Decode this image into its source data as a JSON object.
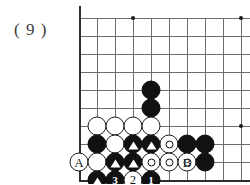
{
  "figure": {
    "label": "( 9 )",
    "caption_number": "9"
  },
  "colors": {
    "black_stone": "#111114",
    "white_stone": "#ffffff",
    "grid_line": "#6e6e72",
    "board_edge": "#2e2e32",
    "background": "#ffffff",
    "text": "#1b1b1d"
  },
  "board": {
    "type": "go-board-corner",
    "origin_x": 79,
    "origin_y": 18,
    "cell": 18,
    "cols": 10,
    "rows": 9,
    "star_points": [
      {
        "col": 3,
        "row": 0
      },
      {
        "col": 9,
        "row": 0
      },
      {
        "col": 9,
        "row": 6
      }
    ],
    "edges": {
      "left": true,
      "bottom": true,
      "top": false,
      "right": false
    }
  },
  "coordinate_labels": [
    {
      "text": "A",
      "col": 0,
      "row": 8
    },
    {
      "text": "B",
      "col": 6,
      "row": 8
    }
  ],
  "stones": [
    {
      "color": "black",
      "col": 4,
      "row": 4,
      "mark": "none",
      "label": ""
    },
    {
      "color": "black",
      "col": 4,
      "row": 5,
      "mark": "none",
      "label": ""
    },
    {
      "color": "white",
      "col": 1,
      "row": 6,
      "mark": "none",
      "label": ""
    },
    {
      "color": "white",
      "col": 2,
      "row": 6,
      "mark": "none",
      "label": ""
    },
    {
      "color": "white",
      "col": 3,
      "row": 6,
      "mark": "none",
      "label": ""
    },
    {
      "color": "black",
      "col": 1,
      "row": 7,
      "mark": "none",
      "label": ""
    },
    {
      "color": "white",
      "col": 2,
      "row": 7,
      "mark": "none",
      "label": ""
    },
    {
      "color": "black",
      "col": 3,
      "row": 7,
      "mark": "triangle",
      "label": ""
    },
    {
      "color": "black",
      "col": 4,
      "row": 7,
      "mark": "triangle",
      "label": ""
    },
    {
      "color": "white",
      "col": 5,
      "row": 7,
      "mark": "ring",
      "label": ""
    },
    {
      "color": "black",
      "col": 6,
      "row": 7,
      "mark": "none",
      "label": ""
    },
    {
      "color": "black",
      "col": 7,
      "row": 7,
      "mark": "none",
      "label": ""
    },
    {
      "color": "white",
      "col": 0,
      "row": 8,
      "mark": "none",
      "label": ""
    },
    {
      "color": "white",
      "col": 1,
      "row": 8,
      "mark": "none",
      "label": ""
    },
    {
      "color": "black",
      "col": 2,
      "row": 8,
      "mark": "triangle",
      "label": ""
    },
    {
      "color": "black",
      "col": 3,
      "row": 8,
      "mark": "triangle",
      "label": ""
    },
    {
      "color": "white",
      "col": 4,
      "row": 8,
      "mark": "ring",
      "label": ""
    },
    {
      "color": "white",
      "col": 5,
      "row": 8,
      "mark": "ring",
      "label": ""
    },
    {
      "color": "white",
      "col": 6,
      "row": 8,
      "mark": "ring",
      "label": ""
    },
    {
      "color": "black",
      "col": 7,
      "row": 8,
      "mark": "none",
      "label": ""
    },
    {
      "color": "black",
      "col": 1,
      "row": 9,
      "mark": "triangle",
      "label": ""
    },
    {
      "color": "black",
      "col": 2,
      "row": 9,
      "mark": "number",
      "label": "3"
    },
    {
      "color": "white",
      "col": 3,
      "row": 9,
      "mark": "number",
      "label": "2"
    },
    {
      "color": "black",
      "col": 4,
      "row": 9,
      "mark": "number",
      "label": "1"
    },
    {
      "color": "white",
      "col": 4,
      "row": 6,
      "mark": "none",
      "label": ""
    }
  ],
  "move_numbers": [
    "1",
    "2",
    "3"
  ]
}
